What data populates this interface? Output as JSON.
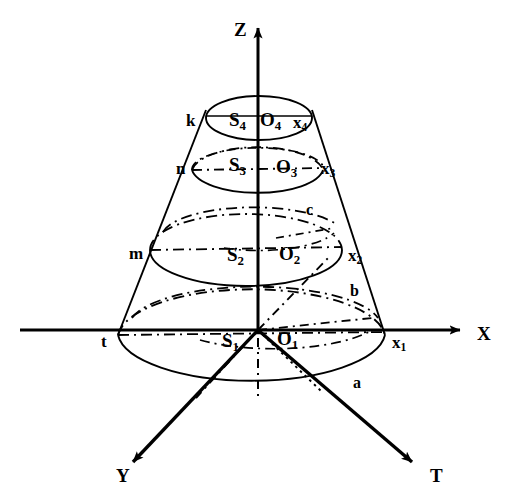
{
  "figure": {
    "background_color": "#ffffff",
    "line_color": "#000000"
  },
  "axes": [
    {
      "name": "x-axis",
      "label": "X",
      "direction": "right",
      "arrow": true,
      "label_pos": {
        "x": 477,
        "y": 324
      }
    },
    {
      "name": "z-axis",
      "label": "Z",
      "direction": "up",
      "arrow": true,
      "label_pos": {
        "x": 234,
        "y": 20
      }
    },
    {
      "name": "y-axis",
      "label": "Y",
      "direction": "down-left",
      "arrow": true,
      "label_pos": {
        "x": 116,
        "y": 466
      }
    },
    {
      "name": "t-axis",
      "label": "T",
      "direction": "down-right",
      "arrow": true,
      "label_pos": {
        "x": 430,
        "y": 466
      }
    }
  ],
  "levels": [
    {
      "name": "level-1-base",
      "left_label": "t",
      "left_label_pos": {
        "x": 101,
        "y": 333
      },
      "s_label": "S",
      "s_sub": "1",
      "s_label_pos": {
        "x": 222,
        "y": 331
      },
      "o_label": "O",
      "o_sub": "1",
      "o_label_pos": {
        "x": 277,
        "y": 329
      },
      "right_label": "x",
      "right_sub": "1",
      "right_label_pos": {
        "x": 392,
        "y": 334
      }
    },
    {
      "name": "level-2",
      "left_label": "m",
      "left_label_pos": {
        "x": 129,
        "y": 245
      },
      "s_label": "S",
      "s_sub": "2",
      "s_label_pos": {
        "x": 227,
        "y": 245
      },
      "o_label": "O",
      "o_sub": "2",
      "o_label_pos": {
        "x": 279,
        "y": 244
      },
      "right_label": "x",
      "right_sub": "2",
      "right_label_pos": {
        "x": 348,
        "y": 247
      }
    },
    {
      "name": "level-3",
      "left_label": "n",
      "left_label_pos": {
        "x": 176,
        "y": 160
      },
      "s_label": "S",
      "s_sub": "3",
      "s_label_pos": {
        "x": 229,
        "y": 155
      },
      "o_label": "O",
      "o_sub": "3",
      "o_label_pos": {
        "x": 276,
        "y": 157
      },
      "right_label": "x",
      "right_sub": "3",
      "right_label_pos": {
        "x": 321,
        "y": 160
      }
    },
    {
      "name": "level-4-top",
      "left_label": "k",
      "left_label_pos": {
        "x": 186,
        "y": 112
      },
      "s_label": "S",
      "s_sub": "4",
      "s_label_pos": {
        "x": 229,
        "y": 110
      },
      "o_label": "O",
      "o_sub": "4",
      "o_label_pos": {
        "x": 260,
        "y": 110
      },
      "right_label": "x",
      "right_sub": "4",
      "right_label_pos": {
        "x": 293,
        "y": 114
      }
    }
  ],
  "edge_labels": [
    {
      "name": "edge-label-a",
      "text": "a",
      "pos": {
        "x": 353,
        "y": 375
      }
    },
    {
      "name": "edge-label-b",
      "text": "b",
      "pos": {
        "x": 350,
        "y": 283
      }
    },
    {
      "name": "edge-label-c",
      "text": "c",
      "pos": {
        "x": 306,
        "y": 202
      }
    }
  ]
}
